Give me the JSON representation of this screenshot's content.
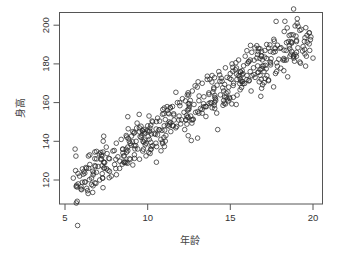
{
  "chart_data": {
    "type": "scatter",
    "title": "",
    "xlabel": "年龄",
    "ylabel": "身高",
    "xlim": [
      4.8,
      20.3
    ],
    "ylim": [
      105,
      203
    ],
    "x_ticks": [
      5,
      10,
      15,
      20
    ],
    "y_ticks": [
      120,
      140,
      160,
      180,
      200
    ],
    "grid": false,
    "legend": null,
    "marker": "open-circle",
    "marker_color": "#2b2b2b",
    "n_points_approx": 500,
    "trend": {
      "description": "strong positive linear relationship",
      "approx_fit": {
        "slope": 5.4,
        "intercept": 88
      }
    },
    "sample_points": [
      [
        5.5,
        121
      ],
      [
        5.8,
        118
      ],
      [
        6.0,
        115
      ],
      [
        6.1,
        123
      ],
      [
        6.2,
        119
      ],
      [
        6.3,
        126
      ],
      [
        6.4,
        113
      ],
      [
        6.5,
        128
      ],
      [
        6.6,
        121
      ],
      [
        6.7,
        117
      ],
      [
        6.8,
        131
      ],
      [
        6.9,
        124
      ],
      [
        7.0,
        127
      ],
      [
        7.1,
        120
      ],
      [
        7.2,
        133
      ],
      [
        7.3,
        116
      ],
      [
        7.4,
        129
      ],
      [
        7.5,
        137
      ],
      [
        7.6,
        125
      ],
      [
        7.7,
        131
      ],
      [
        7.8,
        122
      ],
      [
        7.9,
        135
      ],
      [
        8.0,
        128
      ],
      [
        8.1,
        139
      ],
      [
        8.2,
        132
      ],
      [
        8.3,
        126
      ],
      [
        8.4,
        141
      ],
      [
        8.5,
        134
      ],
      [
        8.6,
        129
      ],
      [
        8.7,
        143
      ],
      [
        8.8,
        137
      ],
      [
        8.9,
        131
      ],
      [
        9.0,
        138
      ],
      [
        9.1,
        145
      ],
      [
        9.2,
        133
      ],
      [
        9.3,
        140
      ],
      [
        9.4,
        136
      ],
      [
        9.5,
        147
      ],
      [
        9.6,
        142
      ],
      [
        9.7,
        135
      ],
      [
        9.8,
        144
      ],
      [
        9.9,
        139
      ],
      [
        10.0,
        148
      ],
      [
        10.1,
        141
      ],
      [
        10.2,
        136
      ],
      [
        10.3,
        150
      ],
      [
        10.4,
        144
      ],
      [
        10.5,
        139
      ],
      [
        10.6,
        152
      ],
      [
        10.7,
        146
      ],
      [
        10.8,
        141
      ],
      [
        10.9,
        154
      ],
      [
        11.0,
        148
      ],
      [
        11.1,
        143
      ],
      [
        11.2,
        156
      ],
      [
        11.3,
        150
      ],
      [
        11.4,
        145
      ],
      [
        11.5,
        158
      ],
      [
        11.6,
        151
      ],
      [
        11.7,
        147
      ],
      [
        11.8,
        160
      ],
      [
        11.9,
        153
      ],
      [
        12.0,
        149
      ],
      [
        12.1,
        162
      ],
      [
        12.2,
        155
      ],
      [
        12.3,
        151
      ],
      [
        12.4,
        164
      ],
      [
        12.5,
        157
      ],
      [
        12.6,
        153
      ],
      [
        12.7,
        166
      ],
      [
        12.8,
        159
      ],
      [
        12.9,
        155
      ],
      [
        13.0,
        168
      ],
      [
        13.1,
        161
      ],
      [
        13.2,
        157
      ],
      [
        13.3,
        170
      ],
      [
        13.4,
        163
      ],
      [
        13.5,
        158
      ],
      [
        13.6,
        172
      ],
      [
        13.7,
        165
      ],
      [
        13.8,
        160
      ],
      [
        13.9,
        174
      ],
      [
        14.0,
        167
      ],
      [
        14.1,
        162
      ],
      [
        14.2,
        169
      ],
      [
        14.3,
        176
      ],
      [
        14.4,
        164
      ],
      [
        14.5,
        171
      ],
      [
        14.6,
        166
      ],
      [
        14.7,
        178
      ],
      [
        14.8,
        173
      ],
      [
        14.9,
        168
      ],
      [
        15.0,
        175
      ],
      [
        15.1,
        180
      ],
      [
        15.2,
        170
      ],
      [
        15.3,
        177
      ],
      [
        15.4,
        172
      ],
      [
        15.5,
        182
      ],
      [
        15.6,
        176
      ],
      [
        15.7,
        171
      ],
      [
        15.8,
        179
      ],
      [
        15.9,
        184
      ],
      [
        16.0,
        174
      ],
      [
        16.1,
        181
      ],
      [
        16.2,
        176
      ],
      [
        16.3,
        186
      ],
      [
        16.4,
        178
      ],
      [
        16.5,
        173
      ],
      [
        16.6,
        183
      ],
      [
        16.7,
        188
      ],
      [
        16.8,
        177
      ],
      [
        16.9,
        184
      ],
      [
        17.0,
        179
      ],
      [
        17.2,
        190
      ],
      [
        17.4,
        181
      ],
      [
        17.6,
        186
      ],
      [
        17.8,
        176
      ],
      [
        18.0,
        188
      ],
      [
        18.2,
        182
      ],
      [
        18.3,
        202
      ],
      [
        18.4,
        191
      ],
      [
        18.6,
        184
      ],
      [
        18.8,
        195
      ],
      [
        19.0,
        186
      ],
      [
        19.2,
        181
      ],
      [
        19.4,
        189
      ],
      [
        19.6,
        184
      ],
      [
        19.8,
        187
      ],
      [
        20.0,
        183
      ]
    ]
  },
  "axes": {
    "x_tick_labels": [
      "5",
      "10",
      "15",
      "20"
    ],
    "y_tick_labels": [
      "120",
      "140",
      "160",
      "180",
      "200"
    ],
    "xlabel": "年龄",
    "ylabel": "身高"
  }
}
